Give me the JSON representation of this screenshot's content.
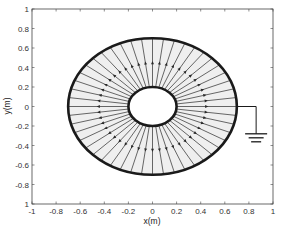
{
  "chart_data": {
    "type": "diagram",
    "title": "",
    "xlabel": "x(m)",
    "ylabel": "y(m)",
    "xlim": [
      -1,
      1
    ],
    "ylim": [
      -1,
      1
    ],
    "xticks": [
      -1,
      -0.8,
      -0.6,
      -0.4,
      -0.2,
      0,
      0.2,
      0.4,
      0.6,
      0.8,
      1
    ],
    "xtick_labels": [
      "-1",
      "-0.8",
      "-0.6",
      "-0.4",
      "-0.2",
      "0",
      "0.2",
      "0.4",
      "0.6",
      "0.8",
      "1"
    ],
    "yticks": [
      1,
      0.8,
      0.6,
      0.4,
      0.2,
      0,
      -0.2,
      -0.4,
      -0.6,
      -0.8,
      -1
    ],
    "ytick_labels": [
      "1",
      "0.8",
      "0.6",
      "0.4",
      "0.2",
      "0",
      "-0.2",
      "-0.4",
      "-0.6",
      "-0.8",
      "1"
    ],
    "grid": false,
    "inner_conductor": {
      "center": [
        0,
        0
      ],
      "radius": 0.2
    },
    "outer_conductor": {
      "center": [
        0,
        0
      ],
      "radius": 0.7,
      "grounded": true
    },
    "field_lines": {
      "count": 48,
      "direction": "radial-outward",
      "arrow_radius": 0.45
    },
    "ground_symbol": {
      "attach_point": [
        0.7,
        0
      ],
      "wire_x": 0.86,
      "bottom_y": -0.28
    }
  },
  "colors": {
    "background": "#ffffff",
    "annulus_fill": "#efefef",
    "conductor": "#1a1a1a",
    "field_line": "#2a2a2a",
    "axes": "#444444"
  }
}
